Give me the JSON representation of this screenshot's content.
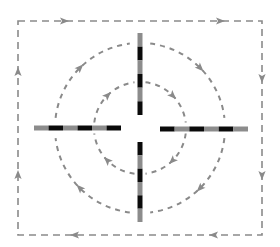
{
  "diagram": {
    "colors": {
      "background": "#ffffff",
      "dashed_line": "#8a8a8a",
      "bar_dark": "#0a0a0a",
      "bar_light": "#8c8c8c"
    },
    "center": {
      "x": 140,
      "y": 128
    },
    "outer_frame": {
      "x": 18,
      "y": 21,
      "width": 244,
      "height": 214,
      "direction": "clockwise",
      "arrows": [
        {
          "x": 64,
          "y": 21,
          "dir": "right"
        },
        {
          "x": 220,
          "y": 21,
          "dir": "right"
        },
        {
          "x": 262,
          "y": 78,
          "dir": "down"
        },
        {
          "x": 262,
          "y": 175,
          "dir": "down"
        },
        {
          "x": 214,
          "y": 235,
          "dir": "left"
        },
        {
          "x": 75,
          "y": 235,
          "dir": "left"
        },
        {
          "x": 18,
          "y": 175,
          "dir": "up"
        },
        {
          "x": 18,
          "y": 72,
          "dir": "up"
        }
      ]
    },
    "circles": [
      {
        "name": "outer-circle",
        "radius": 85,
        "direction": "clockwise"
      },
      {
        "name": "inner-circle",
        "radius": 46,
        "direction": "clockwise"
      }
    ],
    "bars": [
      {
        "name": "bar-top",
        "x1": 140,
        "y1": 33,
        "x2": 140,
        "y2": 115,
        "segments": [
          "light",
          "dark",
          "light",
          "dark",
          "light",
          "dark"
        ]
      },
      {
        "name": "bar-bottom",
        "x1": 140,
        "y1": 142,
        "x2": 140,
        "y2": 222,
        "segments": [
          "dark",
          "light",
          "dark",
          "light",
          "dark",
          "light"
        ]
      },
      {
        "name": "bar-left",
        "x1": 34,
        "y1": 128,
        "x2": 121,
        "y2": 128,
        "segments": [
          "light",
          "dark",
          "light",
          "dark",
          "light",
          "dark"
        ]
      },
      {
        "name": "bar-right",
        "x1": 160,
        "y1": 129,
        "x2": 248,
        "y2": 129,
        "segments": [
          "dark",
          "light",
          "dark",
          "light",
          "dark",
          "light"
        ]
      }
    ]
  }
}
